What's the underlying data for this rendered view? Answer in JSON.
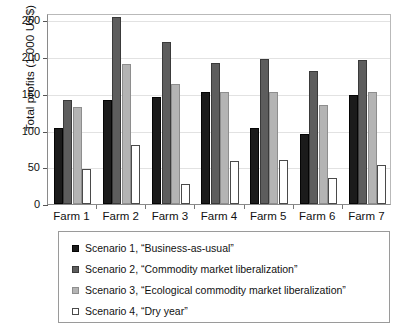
{
  "chart_data": {
    "type": "bar",
    "title": "",
    "xlabel": "",
    "ylabel": "Total profits (1,000 US$)",
    "ylim": [
      0,
      260
    ],
    "yticks": [
      0,
      50,
      100,
      150,
      200,
      250
    ],
    "ytick_labels": [
      "0",
      "50",
      "100",
      "150",
      "200",
      "250"
    ],
    "grid": true,
    "legend_position": "below-plot",
    "categories": [
      "Farm 1",
      "Farm 2",
      "Farm 3",
      "Farm 4",
      "Farm 5",
      "Farm 6",
      "Farm 7"
    ],
    "series": [
      {
        "name": "Scenario 1, “Business-as-usual”",
        "color": "#1b1b1b",
        "values": [
          104,
          142,
          146,
          152,
          104,
          95,
          148
        ]
      },
      {
        "name": "Scenario 2, “Commodity market liberalization”",
        "color": "#5d5d5d",
        "values": [
          141,
          254,
          221,
          192,
          198,
          181,
          196
        ]
      },
      {
        "name": "Scenario 3, “Ecological commodity market liberalization”",
        "color": "#b4b4b4",
        "values": [
          132,
          191,
          164,
          152,
          153,
          135,
          153
        ]
      },
      {
        "name": "Scenario 4, “Dry year”",
        "color": "#ffffff",
        "values": [
          47,
          80,
          27,
          58,
          60,
          36,
          53
        ]
      }
    ]
  },
  "axis": {
    "y_title": "Total profits (1,000 US$)",
    "y_tick_labels": [
      "250",
      "200",
      "150",
      "100",
      "50",
      "0"
    ],
    "x_tick_labels": [
      "Farm 1",
      "Farm 2",
      "Farm 3",
      "Farm 4",
      "Farm 5",
      "Farm 6",
      "Farm 7"
    ]
  },
  "legend": {
    "entries": [
      {
        "label": "Scenario 1, “Business-as-usual”",
        "swatch": "s1"
      },
      {
        "label": "Scenario 2, “Commodity market liberalization”",
        "swatch": "s2"
      },
      {
        "label": "Scenario 3, “Ecological commodity market liberalization”",
        "swatch": "s3"
      },
      {
        "label": "Scenario 4, “Dry year”",
        "swatch": "s4"
      }
    ]
  }
}
